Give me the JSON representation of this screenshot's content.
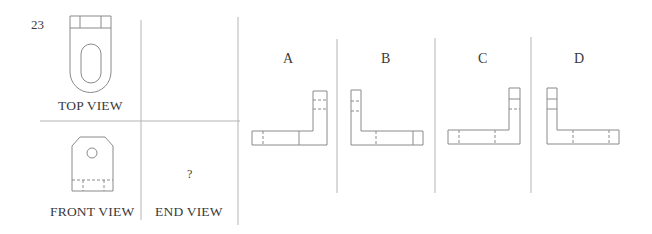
{
  "question": {
    "number": "23",
    "views": {
      "top": "TOP VIEW",
      "front": "FRONT VIEW",
      "end": "END VIEW",
      "end_placeholder": "?"
    },
    "options": [
      {
        "label": "A"
      },
      {
        "label": "B"
      },
      {
        "label": "C"
      },
      {
        "label": "D"
      }
    ]
  },
  "colors": {
    "line": "#8a8a8a",
    "divider": "#b5b5b5",
    "text": "#3a3a3a"
  }
}
